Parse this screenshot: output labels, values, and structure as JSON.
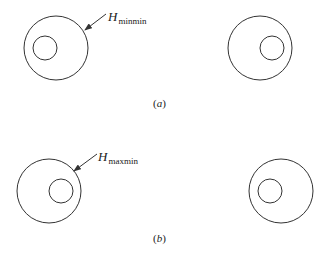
{
  "panels": [
    {
      "id": "a",
      "caption_open": "(",
      "caption_letter": "a",
      "caption_close": ")",
      "label_main": "H",
      "label_sub": "minmin",
      "left_pair": {
        "outer": {
          "cx": 56,
          "cy": 48,
          "r": 32
        },
        "inner": {
          "cx": 45,
          "cy": 48,
          "r": 12
        }
      },
      "right_pair": {
        "outer": {
          "cx": 260,
          "cy": 48,
          "r": 32
        },
        "inner": {
          "cx": 272,
          "cy": 48,
          "r": 12
        }
      },
      "arrow": {
        "x1": 106,
        "y1": 14,
        "x2": 85,
        "y2": 30
      }
    },
    {
      "id": "b",
      "caption_open": "(",
      "caption_letter": "b",
      "caption_close": ")",
      "label_main": "H",
      "label_sub": "maxmin",
      "left_pair": {
        "outer": {
          "cx": 49,
          "cy": 191,
          "r": 32
        },
        "inner": {
          "cx": 61,
          "cy": 191,
          "r": 12
        }
      },
      "right_pair": {
        "outer": {
          "cx": 281,
          "cy": 191,
          "r": 32
        },
        "inner": {
          "cx": 270,
          "cy": 191,
          "r": 12
        }
      },
      "arrow": {
        "x1": 97,
        "y1": 154,
        "x2": 74,
        "y2": 171
      }
    }
  ],
  "colors": {
    "stroke": "#333333",
    "background": "#ffffff"
  }
}
